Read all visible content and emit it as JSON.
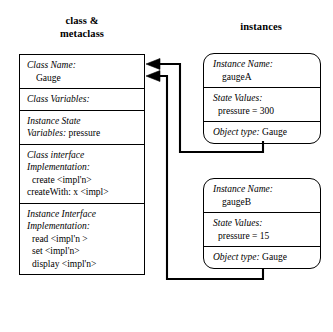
{
  "diagram": {
    "headings": {
      "left": "class &\nmetaclass",
      "left_line1": "class &",
      "left_line2": "metaclass",
      "right": "instances"
    },
    "colors": {
      "background": "#ffffff",
      "stroke": "#000000",
      "text": "#000000"
    }
  },
  "class_box": {
    "name": "Gauge",
    "sections": [
      {
        "id": "class-name",
        "label": "Class Name",
        "label_suffix": ":",
        "value": "Gauge",
        "value_on_new_line": true
      },
      {
        "id": "class-variables",
        "label": "Class Variables",
        "label_suffix": ":",
        "value": "",
        "value_on_new_line": false
      },
      {
        "id": "instance-state-variables",
        "label_line1": "Instance State",
        "label_line2": "Variables",
        "label_suffix": ":",
        "value": "pressure",
        "value_on_new_line": false
      },
      {
        "id": "class-interface-implementation",
        "label_line1": "Class interface",
        "label_line2": "Implementation",
        "label_suffix": ":",
        "methods": [
          "create  <impl'n>",
          "createWith: x <impl>"
        ]
      },
      {
        "id": "instance-interface-implementation",
        "label_line1": "Instance Interface",
        "label_line2": "Implementation",
        "label_suffix": ":",
        "methods": [
          "read  <impl'n >",
          "set  <impl'n>",
          "display  <impl'n>"
        ]
      }
    ]
  },
  "instances": [
    {
      "id": "gaugeA",
      "name_label": "Instance Name",
      "name_label_suffix": ":",
      "name_value": "gaugeA",
      "state_label": "State Values",
      "state_label_suffix": ":",
      "state_value": "pressure = 300",
      "type_label": "Object type",
      "type_label_suffix": ":",
      "type_value": "Gauge"
    },
    {
      "id": "gaugeB",
      "name_label": "Instance Name",
      "name_label_suffix": ":",
      "name_value": "gaugeB",
      "state_label": "State Values",
      "state_label_suffix": ":",
      "state_value": "pressure = 15",
      "type_label": "Object type",
      "type_label_suffix": ":",
      "type_value": "Gauge"
    }
  ],
  "connectors": [
    {
      "id": "gaugeA-to-class",
      "from": "gaugeA",
      "to": "class-box",
      "arrow_at": "class-box-right-upper"
    },
    {
      "id": "gaugeB-to-class",
      "from": "gaugeB",
      "to": "class-box",
      "arrow_at": "class-box-right-lower"
    }
  ]
}
